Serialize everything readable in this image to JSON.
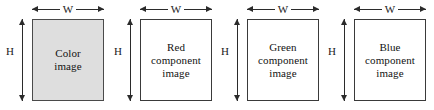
{
  "diagram": {
    "colors": {
      "shaded_fill": "#dedede",
      "plain_fill": "#ffffff",
      "stroke": "#3a3a3a",
      "text": "#121212",
      "background": "#ffffff"
    },
    "panels": [
      {
        "operator": "",
        "height_label": "H",
        "width_label": "W",
        "box_label": "Color\nimage",
        "shaded": true
      },
      {
        "operator": "=",
        "height_label": "H",
        "width_label": "W",
        "box_label": "Red\ncomponent\nimage",
        "shaded": false
      },
      {
        "operator": "+",
        "height_label": "H",
        "width_label": "W",
        "box_label": "Green\ncomponent\nimage",
        "shaded": false
      },
      {
        "operator": "+",
        "height_label": "H",
        "width_label": "W",
        "box_label": "Blue\ncomponent\nimage",
        "shaded": false
      }
    ]
  }
}
